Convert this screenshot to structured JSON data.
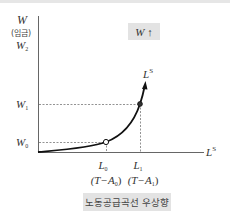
{
  "diagram": {
    "y_axis": {
      "label": "W",
      "sublabel": "(임금)"
    },
    "x_axis": {
      "label": "L",
      "label_sup": "S"
    },
    "curve_label": {
      "base": "L",
      "sup": "S"
    },
    "wage_levels": [
      {
        "base": "W",
        "sub": "2"
      },
      {
        "base": "W",
        "sub": "1"
      },
      {
        "base": "W",
        "sub": "0"
      }
    ],
    "labor_levels": [
      {
        "base": "L",
        "sub": "0",
        "paren": "(T−A",
        "paren_sub": "0",
        "paren_end": ")"
      },
      {
        "base": "L",
        "sub": "1",
        "paren": "(T−A",
        "paren_sub": "1",
        "paren_end": ")"
      }
    ],
    "annotation_box": "W ↑",
    "caption": "노동공급곡선 우상향",
    "colors": {
      "axis": "#555555",
      "curve": "#111111",
      "dashed": "#777777",
      "box_bg": "#e3e3e3",
      "caption_bg": "#e3e3e3"
    }
  }
}
